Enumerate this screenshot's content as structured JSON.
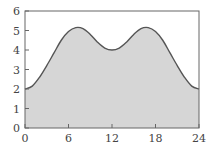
{
  "chart_data": {
    "type": "area",
    "title": "",
    "xlabel": "",
    "ylabel": "",
    "xlim": [
      0,
      24
    ],
    "ylim": [
      0,
      6
    ],
    "x_ticks": [
      0,
      6,
      12,
      18,
      24
    ],
    "y_ticks": [
      0,
      1,
      2,
      3,
      4,
      5,
      6
    ],
    "grid": false,
    "legend": null,
    "x": [
      0,
      1,
      2,
      3,
      4,
      5,
      6,
      7,
      8,
      9,
      10,
      11,
      12,
      13,
      14,
      15,
      16,
      17,
      18,
      19,
      20,
      21,
      22,
      23,
      24
    ],
    "series": [
      {
        "name": "",
        "values": [
          2.0,
          2.15,
          2.6,
          3.2,
          3.85,
          4.5,
          4.95,
          5.15,
          5.1,
          4.8,
          4.4,
          4.1,
          4.0,
          4.1,
          4.4,
          4.8,
          5.1,
          5.15,
          4.95,
          4.5,
          3.85,
          3.2,
          2.6,
          2.15,
          2.0
        ]
      }
    ],
    "colors": {
      "fill": "#d6d6d6",
      "line": "#555555",
      "axis": "#666666",
      "text": "#444444"
    }
  }
}
